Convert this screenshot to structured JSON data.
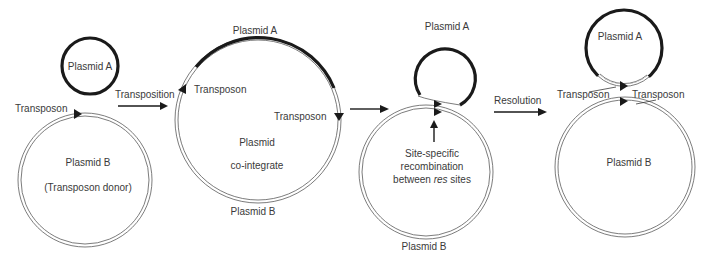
{
  "stage1": {
    "plasmid_a": "Plasmid A",
    "transposon": "Transposon",
    "plasmid_b": "Plasmid B",
    "donor": "(Transposon donor)"
  },
  "arrow1": {
    "label": "Transposition"
  },
  "stage2": {
    "plasmid_a": "Plasmid A",
    "transposon_left": "Transposon",
    "transposon_right": "Transposon",
    "center_line1": "Plasmid",
    "center_line2": "co-integrate",
    "plasmid_b": "Plasmid B"
  },
  "stage3": {
    "plasmid_a": "Plasmid A",
    "note_line1": "Site-specific",
    "note_line2": "recombination",
    "note_line3_pre": "between ",
    "note_line3_em": "res",
    "note_line3_post": " sites",
    "plasmid_b": "Plasmid B"
  },
  "arrow3": {
    "label": "Resolution"
  },
  "stage4": {
    "plasmid_a": "Plasmid A",
    "transposon_left": "Transposon",
    "transposon_right": "Transposon",
    "plasmid_b": "Plasmid B"
  }
}
